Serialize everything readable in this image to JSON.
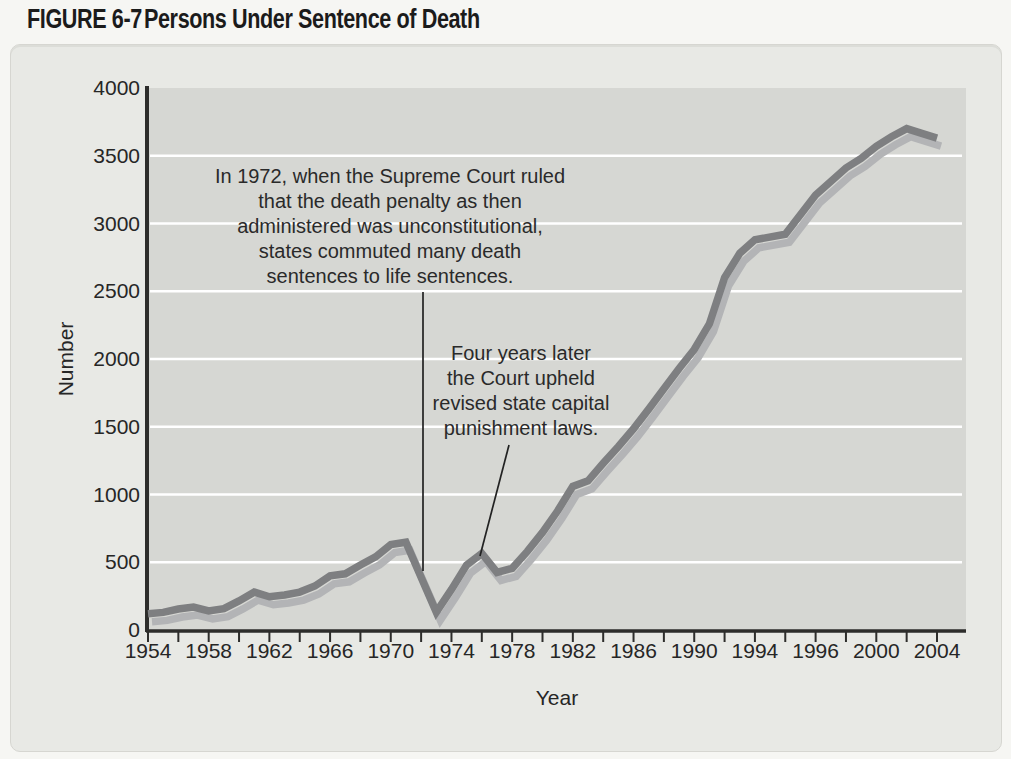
{
  "figure": {
    "label": "FIGURE 6-7",
    "title": "Persons Under Sentence of Death"
  },
  "chart_data": {
    "type": "line",
    "title": "Persons Under Sentence of Death",
    "xlabel": "Year",
    "ylabel": "Number",
    "ylim": [
      0,
      4000
    ],
    "y_ticks": [
      0,
      500,
      1000,
      1500,
      2000,
      2500,
      3000,
      3500,
      4000
    ],
    "x_tick_labels": [
      "1954",
      "1958",
      "1962",
      "1966",
      "1970",
      "1974",
      "1978",
      "1982",
      "1986",
      "1990",
      "1994",
      "1996",
      "2000",
      "2004"
    ],
    "grid": "horizontal white gridlines every 500",
    "legend": "none",
    "series": [
      {
        "name": "Persons under sentence of death",
        "points": [
          [
            1954,
            120
          ],
          [
            1955,
            130
          ],
          [
            1956,
            155
          ],
          [
            1957,
            170
          ],
          [
            1958,
            140
          ],
          [
            1959,
            158
          ],
          [
            1960,
            215
          ],
          [
            1961,
            280
          ],
          [
            1962,
            245
          ],
          [
            1963,
            258
          ],
          [
            1964,
            280
          ],
          [
            1965,
            325
          ],
          [
            1966,
            400
          ],
          [
            1967,
            415
          ],
          [
            1968,
            480
          ],
          [
            1969,
            540
          ],
          [
            1970,
            630
          ],
          [
            1971,
            648
          ],
          [
            1972,
            390
          ],
          [
            1973,
            132
          ],
          [
            1974,
            300
          ],
          [
            1975,
            480
          ],
          [
            1976,
            565
          ],
          [
            1977,
            425
          ],
          [
            1978,
            455
          ],
          [
            1979,
            580
          ],
          [
            1980,
            720
          ],
          [
            1981,
            880
          ],
          [
            1982,
            1060
          ],
          [
            1983,
            1100
          ],
          [
            1984,
            1230
          ],
          [
            1985,
            1355
          ],
          [
            1986,
            1485
          ],
          [
            1987,
            1630
          ],
          [
            1988,
            1780
          ],
          [
            1989,
            1930
          ],
          [
            1990,
            2070
          ],
          [
            1991,
            2260
          ],
          [
            1992,
            2600
          ],
          [
            1993,
            2780
          ],
          [
            1994,
            2880
          ],
          [
            1995,
            2920
          ],
          [
            1996,
            3210
          ],
          [
            1997,
            3310
          ],
          [
            1998,
            3410
          ],
          [
            1999,
            3480
          ],
          [
            2000,
            3570
          ],
          [
            2001,
            3640
          ],
          [
            2002,
            3700
          ],
          [
            2003,
            3665
          ],
          [
            2004,
            3630
          ]
        ]
      }
    ],
    "annotations": [
      {
        "lines": [
          "In 1972, when the Supreme Court ruled",
          "that the death penalty as then",
          "administered was unconstitutional,",
          "states commuted many death",
          "sentences to life sentences."
        ],
        "text": "In 1972, when the Supreme Court ruled that the death penalty as then administered was unconstitutional, states commuted many death sentences to life sentences."
      },
      {
        "lines": [
          "Four years later",
          "the Court upheld",
          "revised state capital",
          "punishment laws."
        ],
        "text": "Four years later the Court upheld revised state capital punishment laws."
      }
    ]
  },
  "colors": {
    "page_bg": "#f6f6f3",
    "panel_bg": "#e8e9e5",
    "plot_bg": "#d6d7d3",
    "gridline": "#ffffff",
    "axis": "#2d2d2b",
    "line_dark": "#7e7f81",
    "line_shadow": "#b3b4b6",
    "text": "#262626"
  }
}
